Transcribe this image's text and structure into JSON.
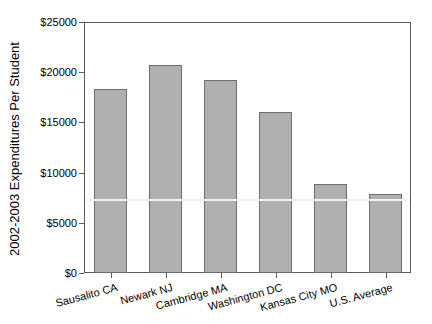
{
  "chart_data": {
    "type": "bar",
    "title": "",
    "xlabel": "",
    "ylabel": "2002-2003 Expenditures Per Student",
    "categories": [
      "Sausalito CA",
      "Newark NJ",
      "Cambridge MA",
      "Washington DC",
      "Kansas City MO",
      "U.S. Average"
    ],
    "values": [
      18300,
      20700,
      19200,
      16000,
      8900,
      7900
    ],
    "ylim": [
      0,
      25000
    ],
    "ytick_step": 5000,
    "ytick_labels": [
      "$0",
      "$5000",
      "$10000",
      "$15000",
      "$20000",
      "$25000"
    ],
    "reference_line": {
      "value": 7300,
      "color": "#f2f2f2"
    },
    "grid": "off",
    "legend": "none",
    "colors": {
      "bar_fill": "#b0b0b0",
      "bar_border": "#6e6e6e",
      "plot_border": "#5a5a5a",
      "text": "#000000",
      "background": "#ffffff"
    }
  }
}
